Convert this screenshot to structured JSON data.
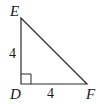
{
  "figure": {
    "type": "right-triangle",
    "vertices": {
      "E": {
        "label": "E",
        "x": 21,
        "y": 18
      },
      "D": {
        "label": "D",
        "x": 21,
        "y": 84
      },
      "F": {
        "label": "F",
        "x": 87,
        "y": 84
      }
    },
    "side_labels": {
      "DE": "4",
      "DF": "4"
    },
    "right_angle_at": "D",
    "stroke_color": "#2a2a2a",
    "text_color": "#1a1a1a"
  }
}
